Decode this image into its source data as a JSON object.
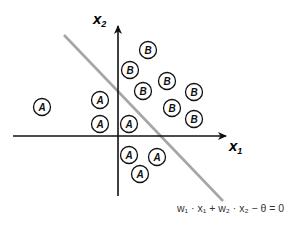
{
  "diagram": {
    "axes": {
      "x_label": "x",
      "x_sub": "1",
      "y_label": "x",
      "y_sub": "2",
      "origin": [
        118,
        136
      ],
      "x_range": [
        13,
        227
      ],
      "y_range": [
        25,
        196
      ],
      "color": "#111111"
    },
    "boundary": {
      "from": [
        64,
        35
      ],
      "to": [
        223,
        201
      ],
      "color": "#a6a6a6",
      "equation": "w₁ · x₁ + w₂ · x₂ − θ = 0"
    },
    "points": [
      {
        "label": "A",
        "cx": 42,
        "cy": 107
      },
      {
        "label": "A",
        "cx": 100,
        "cy": 100
      },
      {
        "label": "A",
        "cx": 100,
        "cy": 124
      },
      {
        "label": "A",
        "cx": 129,
        "cy": 124
      },
      {
        "label": "A",
        "cx": 129,
        "cy": 155
      },
      {
        "label": "A",
        "cx": 157,
        "cy": 157
      },
      {
        "label": "A",
        "cx": 140,
        "cy": 174
      },
      {
        "label": "B",
        "cx": 148,
        "cy": 50
      },
      {
        "label": "B",
        "cx": 130,
        "cy": 70
      },
      {
        "label": "B",
        "cx": 167,
        "cy": 81
      },
      {
        "label": "B",
        "cx": 143,
        "cy": 91
      },
      {
        "label": "B",
        "cx": 194,
        "cy": 92
      },
      {
        "label": "B",
        "cx": 172,
        "cy": 108
      },
      {
        "label": "B",
        "cx": 194,
        "cy": 119
      }
    ],
    "point_radius": 8.5
  }
}
